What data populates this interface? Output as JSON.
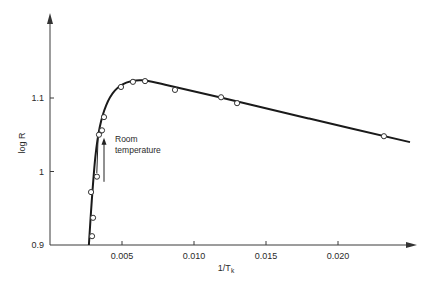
{
  "chart_data": {
    "type": "line",
    "title": "",
    "xlabel": "1/T",
    "xlabel_subscript": "k",
    "ylabel": "log R",
    "xlim": [
      0,
      0.025
    ],
    "ylim": [
      0.9,
      1.27
    ],
    "grid": false,
    "x_ticks": [
      0.005,
      0.01,
      0.015,
      0.02
    ],
    "x_tick_labels": [
      "0.005",
      "0.010",
      "0.015",
      "0.020"
    ],
    "y_ticks": [
      0.9,
      1.0,
      1.1
    ],
    "y_tick_labels": [
      "0.9",
      "1",
      "1.1"
    ],
    "series": [
      {
        "name": "measured",
        "marker": "open-circle",
        "points": [
          {
            "x": 0.00292,
            "y": 0.912
          },
          {
            "x": 0.00299,
            "y": 0.937
          },
          {
            "x": 0.00285,
            "y": 0.972
          },
          {
            "x": 0.00326,
            "y": 0.993
          },
          {
            "x": 0.0034,
            "y": 1.05
          },
          {
            "x": 0.00361,
            "y": 1.056
          },
          {
            "x": 0.00375,
            "y": 1.074
          },
          {
            "x": 0.00493,
            "y": 1.115
          },
          {
            "x": 0.00576,
            "y": 1.122
          },
          {
            "x": 0.0066,
            "y": 1.123
          },
          {
            "x": 0.00868,
            "y": 1.111
          },
          {
            "x": 0.01188,
            "y": 1.101
          },
          {
            "x": 0.01299,
            "y": 1.093
          },
          {
            "x": 0.02319,
            "y": 1.048
          }
        ]
      },
      {
        "name": "fitted-curve",
        "marker": "none",
        "points": [
          {
            "x": 0.0027,
            "y": 0.9
          },
          {
            "x": 0.0029,
            "y": 0.96
          },
          {
            "x": 0.00315,
            "y": 1.02
          },
          {
            "x": 0.00345,
            "y": 1.06
          },
          {
            "x": 0.0039,
            "y": 1.09
          },
          {
            "x": 0.0045,
            "y": 1.11
          },
          {
            "x": 0.0053,
            "y": 1.121
          },
          {
            "x": 0.0064,
            "y": 1.124
          },
          {
            "x": 0.008,
            "y": 1.118
          },
          {
            "x": 0.012,
            "y": 1.1
          },
          {
            "x": 0.018,
            "y": 1.072
          },
          {
            "x": 0.025,
            "y": 1.04
          }
        ]
      },
      {
        "name": "room-temperature-branch",
        "marker": "none",
        "points": [
          {
            "x": 0.00325,
            "y": 0.998
          },
          {
            "x": 0.00335,
            "y": 1.052
          }
        ]
      }
    ],
    "annotations": [
      {
        "text_lines": [
          "Room",
          "temperature"
        ],
        "arrow_x": 0.00375,
        "arrow_from_y": 0.986,
        "arrow_to_y": 1.046,
        "direction": "up"
      }
    ]
  }
}
